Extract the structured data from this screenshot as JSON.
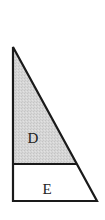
{
  "diagram": {
    "type": "right-triangle-divided",
    "regions": [
      {
        "id": "upper",
        "label": "D",
        "fill": "#d3d3d3",
        "shaded": true
      },
      {
        "id": "lower",
        "label": "E",
        "fill": "#ffffff",
        "shaded": false
      }
    ],
    "stroke_color": "#1a1a1a",
    "geometry": {
      "apex": [
        13,
        47
      ],
      "divider_left": [
        13,
        164
      ],
      "divider_right": [
        76,
        164
      ],
      "base_left": [
        13,
        201
      ],
      "base_right": [
        97,
        201
      ]
    }
  }
}
